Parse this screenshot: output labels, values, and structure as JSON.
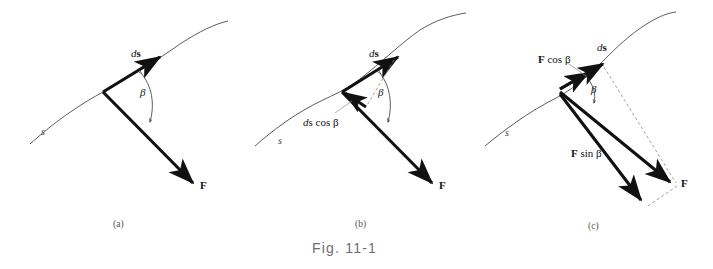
{
  "figure": {
    "caption": "Fig. 11-1",
    "background": "#ffffff",
    "ink": "#111111",
    "curve_color": "#4a4a4a",
    "dash_color": "#8a8a8a"
  },
  "panels": [
    {
      "id": "a",
      "label": "(a)",
      "curve_label": "s",
      "labels": {
        "ds_prefix": "d",
        "ds_vector": "s",
        "beta": "β",
        "force": "F"
      }
    },
    {
      "id": "b",
      "label": "(b)",
      "curve_label": "s",
      "labels": {
        "ds_prefix": "d",
        "ds_vector": "s",
        "beta": "β",
        "force": "F",
        "projection_prefix": "d",
        "projection": "s cos β"
      }
    },
    {
      "id": "c",
      "label": "(c)",
      "curve_label": "s",
      "labels": {
        "ds_prefix": "d",
        "ds_vector": "s",
        "beta": "β",
        "force": "F",
        "f_cos_vec": "F",
        "f_cos_rest": " cos β",
        "f_sin_vec": "F",
        "f_sin_rest": " sin β"
      }
    }
  ]
}
